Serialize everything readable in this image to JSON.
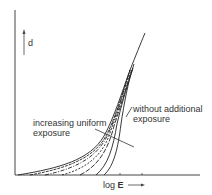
{
  "diagram": {
    "y_axis_label": "d",
    "x_axis_label_prefix": "log ",
    "x_axis_label_var": "E",
    "annotation_increasing": [
      "increasing uniform",
      "exposure"
    ],
    "annotation_without": [
      "without additional",
      "exposure"
    ],
    "colors": {
      "ink": "#333333",
      "background": "#ffffff"
    }
  }
}
